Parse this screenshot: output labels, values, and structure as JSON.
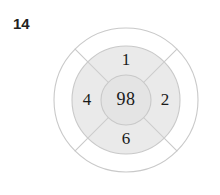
{
  "problem": {
    "number": "14"
  },
  "diagram": {
    "type": "concentric-circle-wheel",
    "center_value": "98",
    "segments": [
      {
        "position": "top",
        "value": "1"
      },
      {
        "position": "right",
        "value": "2"
      },
      {
        "position": "bottom",
        "value": "6"
      },
      {
        "position": "left",
        "value": "4"
      }
    ],
    "colors": {
      "stroke": "#c9c9c9",
      "ring_fill": "#eaeaea",
      "center_fill": "#e4e4e4",
      "outer_fill": "#ffffff",
      "text": "#1a1a1a",
      "number_label": "#231f20",
      "background": "#ffffff"
    },
    "geometry": {
      "center_x": 126,
      "center_y": 100,
      "outer_radius": 72,
      "middle_radius": 54,
      "inner_radius": 25
    }
  }
}
